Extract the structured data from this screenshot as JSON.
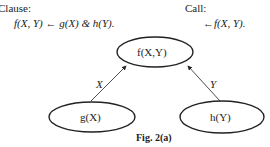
{
  "clause": {
    "label": "Clause:",
    "formula": "f(X, Y) ← g(X) & h(Y)."
  },
  "call": {
    "label": "Call:",
    "formula": "←f(X, Y)."
  },
  "nodes": [
    {
      "id": "f",
      "label": "f(X,Y)"
    },
    {
      "id": "g",
      "label": "g(X)"
    },
    {
      "id": "h",
      "label": "h(Y)"
    }
  ],
  "edges": [
    {
      "from": "g",
      "to": "f",
      "label": "X"
    },
    {
      "from": "h",
      "to": "f",
      "label": "Y"
    }
  ],
  "caption": "Fig. 2(a)"
}
